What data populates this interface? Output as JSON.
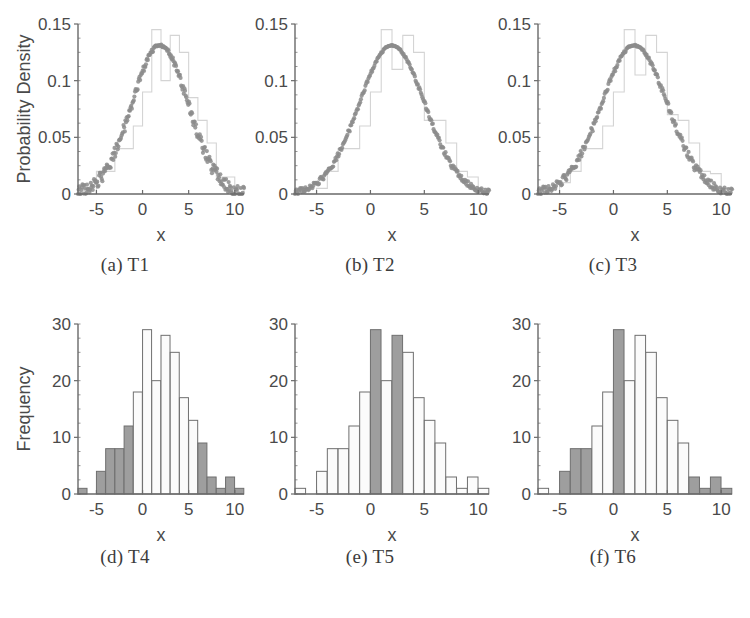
{
  "figure": {
    "background": "#ffffff",
    "curve_color": "#8c8c8c",
    "bar_fill_light": "#fbfbfb",
    "bar_fill_dark": "#9e9e9e",
    "bar_edge": "#6f6f6f",
    "axis_color": "#6a6a6a",
    "text_color": "#4a4a4a"
  },
  "panels": [
    {
      "id": "panel-t1",
      "caption": "(a) T1",
      "chart_data": {
        "type": "area",
        "title": "",
        "xlabel": "x",
        "ylabel": "Probability Density",
        "xlim": [
          -7,
          11
        ],
        "ylim": [
          0,
          0.15
        ],
        "xticks": [
          -5,
          0,
          5,
          10
        ],
        "xtick_labels": [
          "-5",
          "0",
          "5",
          "10"
        ],
        "yticks": [
          0,
          0.05,
          0.1,
          0.15
        ],
        "ytick_labels": [
          "0",
          "0.05",
          "0.1",
          "0.15"
        ],
        "grid": false,
        "legend": "none",
        "series": [
          {
            "name": "fitted normal pdf (scatter)",
            "kind": "scatter",
            "color": "#8c8c8c",
            "mean": 1.9,
            "sigma": 3.05,
            "peak": 0.131,
            "jitter": 0.0045,
            "n_points": 260
          },
          {
            "name": "empirical histogram (density)",
            "kind": "step-outline",
            "color": "#d4d4d4",
            "bin_edges": [
              -7,
              -6,
              -5,
              -4,
              -3,
              -2,
              -1,
              0,
              1,
              2,
              3,
              4,
              5,
              6,
              7,
              8,
              9,
              10,
              11
            ],
            "densities": [
              0.005,
              0.0,
              0.02,
              0.02,
              0.04,
              0.04,
              0.06,
              0.09,
              0.145,
              0.1,
              0.14,
              0.125,
              0.085,
              0.065,
              0.045,
              0.015,
              0.015,
              0.005
            ]
          }
        ]
      }
    },
    {
      "id": "panel-t2",
      "caption": "(b) T2",
      "chart_data": {
        "type": "area",
        "title": "",
        "xlabel": "x",
        "ylabel": "",
        "xlim": [
          -7,
          11
        ],
        "ylim": [
          0,
          0.15
        ],
        "xticks": [
          -5,
          0,
          5,
          10
        ],
        "xtick_labels": [
          "-5",
          "0",
          "5",
          "10"
        ],
        "yticks": [
          0,
          0.05,
          0.1,
          0.15
        ],
        "ytick_labels": [
          "0",
          "0.05",
          "0.1",
          "0.15"
        ],
        "grid": false,
        "legend": "none",
        "series": [
          {
            "name": "fitted normal pdf (scatter)",
            "kind": "scatter",
            "color": "#8c8c8c",
            "mean": 2.0,
            "sigma": 3.05,
            "peak": 0.131,
            "jitter": 0.002,
            "n_points": 260
          },
          {
            "name": "empirical histogram (density)",
            "kind": "step-outline",
            "color": "#d4d4d4",
            "bin_edges": [
              -7,
              -6,
              -5,
              -4,
              -3,
              -2,
              -1,
              0,
              1,
              2,
              3,
              4,
              5,
              6,
              7,
              8,
              9,
              10,
              11
            ],
            "densities": [
              0.005,
              0.0,
              0.005,
              0.02,
              0.04,
              0.04,
              0.06,
              0.09,
              0.145,
              0.11,
              0.14,
              0.125,
              0.065,
              0.065,
              0.045,
              0.02,
              0.015,
              0.005
            ]
          }
        ]
      }
    },
    {
      "id": "panel-t3",
      "caption": "(c) T3",
      "chart_data": {
        "type": "area",
        "title": "",
        "xlabel": "x",
        "ylabel": "",
        "xlim": [
          -7,
          11
        ],
        "ylim": [
          0,
          0.15
        ],
        "xticks": [
          -5,
          0,
          5,
          10
        ],
        "xtick_labels": [
          "-5",
          "0",
          "5",
          "10"
        ],
        "yticks": [
          0,
          0.05,
          0.1,
          0.15
        ],
        "ytick_labels": [
          "0",
          "0.05",
          "0.1",
          "0.15"
        ],
        "grid": false,
        "legend": "none",
        "series": [
          {
            "name": "fitted normal pdf (scatter)",
            "kind": "scatter",
            "color": "#8c8c8c",
            "mean": 1.95,
            "sigma": 3.05,
            "peak": 0.131,
            "jitter": 0.003,
            "n_points": 260
          },
          {
            "name": "empirical histogram (density)",
            "kind": "step-outline",
            "color": "#d4d4d4",
            "bin_edges": [
              -7,
              -6,
              -5,
              -4,
              -3,
              -2,
              -1,
              0,
              1,
              2,
              3,
              4,
              5,
              6,
              7,
              8,
              9,
              10,
              11
            ],
            "densities": [
              0.005,
              0.0,
              0.01,
              0.02,
              0.04,
              0.04,
              0.06,
              0.09,
              0.145,
              0.105,
              0.14,
              0.125,
              0.07,
              0.065,
              0.045,
              0.02,
              0.018,
              0.005
            ]
          }
        ]
      }
    },
    {
      "id": "panel-t4",
      "caption": "(d) T4",
      "chart_data": {
        "type": "bar",
        "title": "",
        "xlabel": "x",
        "ylabel": "Frequency",
        "xlim": [
          -7,
          11
        ],
        "ylim": [
          0,
          30
        ],
        "xticks": [
          -5,
          0,
          5,
          10
        ],
        "xtick_labels": [
          "-5",
          "0",
          "5",
          "10"
        ],
        "yticks": [
          0,
          10,
          20,
          30
        ],
        "ytick_labels": [
          "0",
          "10",
          "20",
          "30"
        ],
        "grid": false,
        "legend": "none",
        "bin_edges": [
          -7,
          -6,
          -5,
          -4,
          -3,
          -2,
          -1,
          0,
          1,
          2,
          3,
          4,
          5,
          6,
          7,
          8,
          9,
          10,
          11
        ],
        "categories": [
          "-7",
          "-6",
          "-5",
          "-4",
          "-3",
          "-2",
          "-1",
          "0",
          "1",
          "2",
          "3",
          "4",
          "5",
          "6",
          "7",
          "8",
          "9",
          "10"
        ],
        "values": [
          1,
          0,
          4,
          8,
          8,
          12,
          18,
          29,
          20,
          28,
          25,
          17,
          13,
          9,
          3,
          1,
          3,
          1
        ],
        "shaded": [
          true,
          true,
          true,
          true,
          true,
          true,
          false,
          false,
          false,
          false,
          false,
          false,
          false,
          true,
          true,
          true,
          true,
          true
        ]
      }
    },
    {
      "id": "panel-t5",
      "caption": "(e) T5",
      "chart_data": {
        "type": "bar",
        "title": "",
        "xlabel": "x",
        "ylabel": "",
        "xlim": [
          -7,
          11
        ],
        "ylim": [
          0,
          30
        ],
        "xticks": [
          -5,
          0,
          5,
          10
        ],
        "xtick_labels": [
          "-5",
          "0",
          "5",
          "10"
        ],
        "yticks": [
          0,
          10,
          20,
          30
        ],
        "ytick_labels": [
          "0",
          "10",
          "20",
          "30"
        ],
        "grid": false,
        "legend": "none",
        "bin_edges": [
          -7,
          -6,
          -5,
          -4,
          -3,
          -2,
          -1,
          0,
          1,
          2,
          3,
          4,
          5,
          6,
          7,
          8,
          9,
          10,
          11
        ],
        "categories": [
          "-7",
          "-6",
          "-5",
          "-4",
          "-3",
          "-2",
          "-1",
          "0",
          "1",
          "2",
          "3",
          "4",
          "5",
          "6",
          "7",
          "8",
          "9",
          "10"
        ],
        "values": [
          1,
          0,
          4,
          8,
          8,
          12,
          18,
          29,
          20,
          28,
          25,
          17,
          13,
          9,
          3,
          1,
          3,
          1
        ],
        "shaded": [
          false,
          false,
          false,
          false,
          false,
          false,
          false,
          true,
          false,
          true,
          false,
          false,
          false,
          false,
          false,
          false,
          false,
          false
        ]
      }
    },
    {
      "id": "panel-t6",
      "caption": "(f) T6",
      "chart_data": {
        "type": "bar",
        "title": "",
        "xlabel": "x",
        "ylabel": "",
        "xlim": [
          -7,
          11
        ],
        "ylim": [
          0,
          30
        ],
        "xticks": [
          -5,
          0,
          5,
          10
        ],
        "xtick_labels": [
          "-5",
          "0",
          "5",
          "10"
        ],
        "yticks": [
          0,
          10,
          20,
          30
        ],
        "ytick_labels": [
          "0",
          "10",
          "20",
          "30"
        ],
        "grid": false,
        "legend": "none",
        "bin_edges": [
          -7,
          -6,
          -5,
          -4,
          -3,
          -2,
          -1,
          0,
          1,
          2,
          3,
          4,
          5,
          6,
          7,
          8,
          9,
          10,
          11
        ],
        "categories": [
          "-7",
          "-6",
          "-5",
          "-4",
          "-3",
          "-2",
          "-1",
          "0",
          "1",
          "2",
          "3",
          "4",
          "5",
          "6",
          "7",
          "8",
          "9",
          "10"
        ],
        "values": [
          1,
          0,
          4,
          8,
          8,
          12,
          18,
          29,
          20,
          28,
          25,
          17,
          13,
          9,
          3,
          1,
          3,
          1
        ],
        "shaded": [
          false,
          false,
          true,
          true,
          true,
          false,
          false,
          true,
          false,
          false,
          false,
          false,
          false,
          false,
          true,
          true,
          true,
          true
        ]
      }
    }
  ]
}
